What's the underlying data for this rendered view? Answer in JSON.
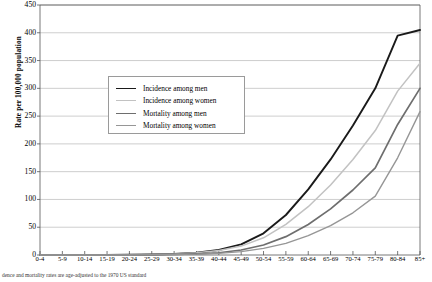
{
  "chart_data": {
    "type": "line",
    "title": "",
    "xlabel": "",
    "ylabel": "Rate per 100,000 population",
    "ylim": [
      0,
      450
    ],
    "ytick_step": 50,
    "yticks": [
      0,
      50,
      100,
      150,
      200,
      250,
      300,
      350,
      400,
      450
    ],
    "grid": true,
    "legend_position": "upper-left-inside",
    "categories": [
      "0-4",
      "5-9",
      "10-14",
      "15-19",
      "20-24",
      "25-29",
      "30-34",
      "35-39",
      "40-44",
      "45-49",
      "50-54",
      "55-59",
      "60-64",
      "65-69",
      "70-74",
      "75-79",
      "80-84",
      "85+"
    ],
    "series": [
      {
        "name": "Incidence among men",
        "color": "#1a1a1a",
        "width": 1.9,
        "values": [
          0,
          0,
          0,
          0,
          0.5,
          1,
          2,
          4,
          9,
          19,
          39,
          72,
          118,
          172,
          233,
          300,
          395,
          405
        ]
      },
      {
        "name": "Incidence among women",
        "color": "#c2c2c2",
        "width": 1.5,
        "values": [
          0,
          0,
          0,
          0,
          0.5,
          1,
          2,
          4,
          8,
          16,
          31,
          55,
          87,
          126,
          172,
          224,
          295,
          345
        ]
      },
      {
        "name": "Mortality among men",
        "color": "#6e6e6e",
        "width": 1.7,
        "values": [
          0,
          0,
          0,
          0,
          0,
          0.5,
          1,
          2,
          4,
          9,
          18,
          33,
          55,
          83,
          117,
          157,
          235,
          300
        ]
      },
      {
        "name": "Mortality among women",
        "color": "#969696",
        "width": 1.4,
        "values": [
          0,
          0,
          0,
          0,
          0,
          0.5,
          1,
          1.5,
          3,
          6,
          12,
          21,
          35,
          53,
          76,
          106,
          175,
          258
        ]
      }
    ],
    "footnote": "dence and mortality rates are age-adjusted to the 1970 US standard"
  },
  "legend": {
    "items": [
      {
        "label": "Incidence among men"
      },
      {
        "label": "Incidence among women"
      },
      {
        "label": "Mortality among men"
      },
      {
        "label": "Mortality among women"
      }
    ]
  }
}
